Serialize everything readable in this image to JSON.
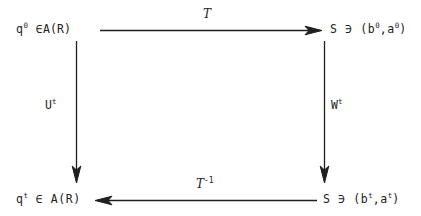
{
  "diagram": {
    "type": "commutative-diagram",
    "background_color": "#ffffff",
    "ink_color": "#1f1f1f",
    "nodes": {
      "top_left": {
        "base": "q",
        "exponent": "0",
        "relation": "∈",
        "set": "A(R)",
        "full_text": "q⁰ ∈ A(R)"
      },
      "top_right": {
        "set": "S",
        "relation": "∋",
        "tuple": "(b⁰,a⁰)",
        "full_text": "S ∋ (b⁰,a⁰)"
      },
      "bottom_left": {
        "base": "q",
        "exponent": "t",
        "relation": "∈",
        "set": "A(R)",
        "full_text": "qᵗ ∈ A(R)"
      },
      "bottom_right": {
        "set": "S",
        "relation": "∋",
        "tuple": "(bᵗ,aᵗ)",
        "full_text": "S ∋ (bᵗ,aᵗ)"
      }
    },
    "edges": {
      "top": {
        "label": "T",
        "exponent": "",
        "direction": "right",
        "from": "top_left",
        "to": "top_right"
      },
      "bottom": {
        "label": "T",
        "exponent": "-1",
        "direction": "left",
        "from": "bottom_right",
        "to": "bottom_left"
      },
      "left": {
        "label": "U",
        "exponent": "t",
        "direction": "down",
        "from": "top_left",
        "to": "bottom_left"
      },
      "right": {
        "label": "W",
        "exponent": "t",
        "direction": "down",
        "from": "top_right",
        "to": "bottom_right"
      }
    },
    "node_parts": {
      "q_letter": "q",
      "zero_sup": "0",
      "t_sup": "t",
      "in_symbol": "∈",
      "ni_symbol": "∋",
      "a_r_set": "A(R)",
      "s_set": "S",
      "tuple_zero": "(b",
      "tuple_zero_mid": ",a",
      "tuple_close": ")",
      "b_letter": "b",
      "a_letter": "a",
      "comma": ",",
      "open_paren": "(",
      "close_paren": ")"
    },
    "edge_parts": {
      "t_letter": "T",
      "inverse_sup": "-1",
      "u_letter": "U",
      "w_letter": "W",
      "t_exp": "t"
    }
  }
}
